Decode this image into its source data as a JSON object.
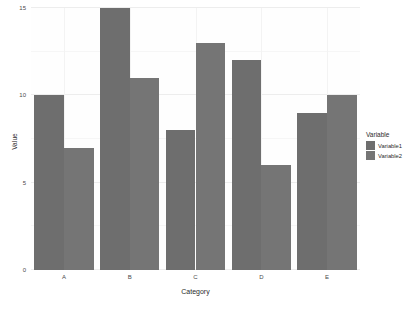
{
  "chart_data": {
    "type": "bar",
    "title": "",
    "xlabel": "Category",
    "ylabel": "Value",
    "categories": [
      "A",
      "B",
      "C",
      "D",
      "E"
    ],
    "series": [
      {
        "name": "Variable1",
        "values": [
          10,
          15,
          8,
          12,
          9
        ],
        "color": "#6e6e6e"
      },
      {
        "name": "Variable2",
        "values": [
          7,
          11,
          13,
          6,
          10
        ],
        "color": "#757575"
      }
    ],
    "ylim": [
      0,
      15
    ],
    "yticks": [
      0,
      5,
      10,
      15
    ],
    "ytick_labels": [
      "0",
      "5",
      "10",
      "15"
    ],
    "grid": true,
    "legend_position": "right",
    "legend_title": "Variable",
    "panel_background": "#fefefe",
    "grid_color": "#ededed",
    "axis_text_color": "#4a4a4a"
  }
}
